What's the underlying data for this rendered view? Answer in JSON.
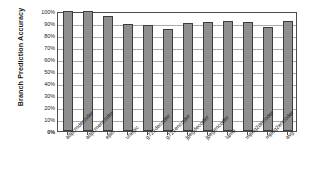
{
  "chart_data": {
    "type": "bar",
    "title": "",
    "xlabel": "",
    "ylabel": "Branch Prediction Accuracy",
    "ylim": [
      0,
      100
    ],
    "ytick_labels": [
      "100%",
      "90%",
      "80%",
      "70%",
      "60%",
      "50%",
      "40%",
      "30%",
      "20%",
      "10%",
      "0%"
    ],
    "ytick_values": [
      100,
      90,
      80,
      70,
      60,
      50,
      40,
      30,
      20,
      10,
      0
    ],
    "grid": true,
    "legend": "none",
    "bar_color": "#8f8f8f",
    "bar_edge_color": "#3d3d3d",
    "categories": [
      "adpcmdecoder",
      "adpcmencoder",
      "epic",
      "unepic",
      "g721decoder",
      "g721encoder",
      "jpegdecoder",
      "jpegencoder",
      "lame",
      "mpeg2decoder",
      "mpeg2encoder",
      "avg"
    ],
    "values": [
      100,
      100,
      96,
      89,
      88.5,
      85,
      90,
      91,
      92,
      90.5,
      87,
      91.5
    ]
  }
}
